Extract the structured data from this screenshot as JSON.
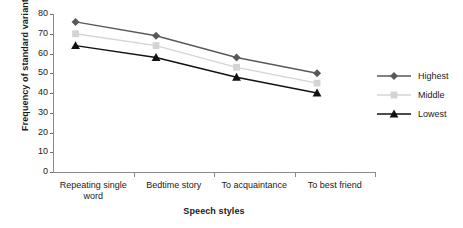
{
  "chart_data": {
    "type": "line",
    "title": "",
    "xlabel": "Speech styles",
    "ylabel": "Frequency of standard variant",
    "categories": [
      "Repeating single word",
      "Bedtime story",
      "To acquaintance",
      "To best friend"
    ],
    "category_lines": [
      [
        "Repeating single",
        "word"
      ],
      [
        "Bedtime story"
      ],
      [
        "To acquaintance"
      ],
      [
        "To best friend"
      ]
    ],
    "series": [
      {
        "name": "Highest",
        "marker": "diamond",
        "color": "#595959",
        "values": [
          76,
          69,
          58,
          50
        ]
      },
      {
        "name": "Middle",
        "marker": "square",
        "color": "#d4d4d4",
        "values": [
          70,
          64,
          53,
          45
        ]
      },
      {
        "name": "Lowest",
        "marker": "triangle",
        "color": "#111111",
        "values": [
          64,
          58,
          48,
          40
        ]
      }
    ],
    "ylim": [
      0,
      80
    ],
    "yticks": [
      0,
      10,
      20,
      30,
      40,
      50,
      60,
      70,
      80
    ],
    "ytick_labels": [
      "0",
      "10",
      "20",
      "30",
      "40",
      "50",
      "60",
      "70",
      "80"
    ],
    "grid": false,
    "legend_position": "right"
  }
}
